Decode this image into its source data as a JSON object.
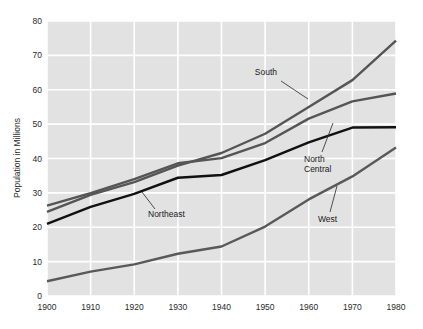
{
  "chart_data": {
    "type": "line",
    "title": "",
    "subtitle": "",
    "xlabel": "",
    "ylabel": "Population in Millions",
    "x": [
      1900,
      1910,
      1920,
      1930,
      1940,
      1950,
      1960,
      1970,
      1980
    ],
    "xticklabels": [
      "1900",
      "1910",
      "1920",
      "1930",
      "1940",
      "1950",
      "1960",
      "1970",
      "1980"
    ],
    "yticklabels": [
      "0",
      "10",
      "20",
      "30",
      "40",
      "50",
      "60",
      "70",
      "80"
    ],
    "yticks": [
      0,
      10,
      20,
      30,
      40,
      50,
      60,
      70,
      80
    ],
    "xlim": [
      1900,
      1980
    ],
    "ylim": [
      0,
      80
    ],
    "grid": true,
    "legend": "inline-annotations",
    "background_color": "#e2e2e2",
    "gridline_color": "#ffffff",
    "series": [
      {
        "name": "South",
        "label": "South",
        "color": "#555555",
        "values": [
          24.5,
          29.4,
          33.1,
          37.9,
          41.6,
          47.2,
          55.0,
          62.8,
          74.3
        ]
      },
      {
        "name": "North Central",
        "label": "North Central",
        "color": "#555555",
        "values": [
          26.3,
          29.9,
          34.0,
          38.6,
          40.1,
          44.5,
          51.6,
          56.6,
          58.9
        ]
      },
      {
        "name": "Northeast",
        "label": "Northeast",
        "color": "#111111",
        "values": [
          21.0,
          25.9,
          29.7,
          34.4,
          35.2,
          39.5,
          44.7,
          49.0,
          49.1
        ]
      },
      {
        "name": "West",
        "label": "West",
        "color": "#595959",
        "values": [
          4.3,
          7.1,
          9.2,
          12.3,
          14.4,
          20.2,
          28.1,
          34.8,
          43.2
        ]
      }
    ],
    "annotations": [
      {
        "text": "South",
        "series": "South"
      },
      {
        "text": "North",
        "series": "North Central"
      },
      {
        "text": "Central",
        "series": "North Central"
      },
      {
        "text": "Northeast",
        "series": "Northeast"
      },
      {
        "text": "West",
        "series": "West"
      }
    ]
  }
}
